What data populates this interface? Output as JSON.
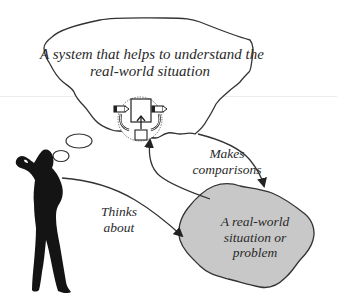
{
  "diagram": {
    "type": "conceptual-diagram",
    "nodes": {
      "system_cloud": {
        "label": "A system that helps to understand the real-world situation",
        "line1": "A system that helps to understand the",
        "line2": "real-world situation",
        "fill": "#ffffff",
        "stroke": "#333333"
      },
      "real_world_blob": {
        "label": "A real-world situation or problem",
        "line1": "A real-world",
        "line2": "situation or",
        "line3": "problem",
        "fill": "#c8c8c8",
        "stroke": "#333333"
      },
      "person": {
        "description": "silhouette of a person thinking, hand on head",
        "fill": "#141414"
      },
      "system_icon": {
        "description": "system box with input/output arrows and feedback loops inside dotted circle"
      }
    },
    "edges": [
      {
        "from": "person",
        "to": "real_world_blob",
        "label": "Thinks about",
        "line1": "Thinks",
        "line2": "about"
      },
      {
        "from": "system_cloud",
        "to": "real_world_blob",
        "label": "Makes comparisons",
        "line1": "Makes",
        "line2": "comparisons"
      },
      {
        "from": "real_world_blob",
        "to": "system_cloud",
        "label": ""
      }
    ],
    "colors": {
      "line": "#333333",
      "text": "#2a2a2a",
      "blob_fill": "#c8c8c8",
      "silhouette": "#141414"
    }
  }
}
